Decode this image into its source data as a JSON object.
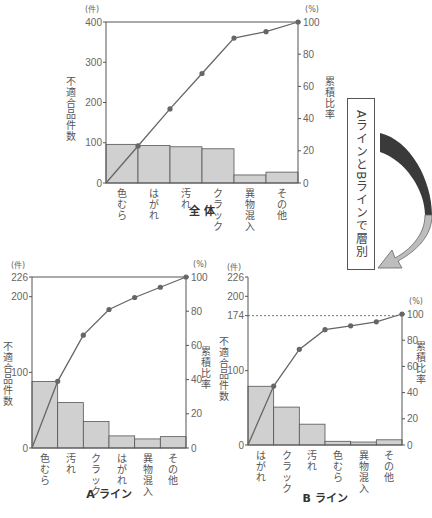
{
  "chart_data": [
    {
      "type": "bar+line (pareto)",
      "title": "全 体",
      "categories": [
        "色むら",
        "はがれ",
        "汚れ",
        "クラック",
        "異物混入",
        "その他"
      ],
      "series": [
        {
          "name": "不適合品件数",
          "values": [
            96,
            93,
            90,
            85,
            20,
            27
          ]
        },
        {
          "name": "累積比率",
          "values": [
            23,
            46,
            68,
            90,
            94,
            100
          ]
        }
      ],
      "ylabel": "不適合品件数",
      "ylabel_unit": "(件)",
      "y2label": "累積比率",
      "y2label_unit": "(%)",
      "ylim": [
        0,
        400
      ],
      "yticks": [
        0,
        100,
        200,
        300,
        400
      ],
      "y2lim": [
        0,
        100
      ],
      "y2ticks": [
        0,
        20,
        40,
        60,
        80,
        100
      ]
    },
    {
      "type": "bar+line (pareto)",
      "title": "A ライン",
      "categories": [
        "色むら",
        "汚れ",
        "クラック",
        "はがれ",
        "異物混入",
        "その他"
      ],
      "series": [
        {
          "name": "不適合品件数",
          "values": [
            88,
            60,
            35,
            16,
            12,
            15
          ]
        },
        {
          "name": "累積比率",
          "values": [
            39,
            66,
            81,
            88,
            94,
            100
          ]
        }
      ],
      "ylabel": "不適合品件数",
      "ylabel_unit": "(件)",
      "y2label": "累積比率",
      "y2label_unit": "(%)",
      "ylim": [
        0,
        226
      ],
      "yticks": [
        0,
        100,
        200,
        226
      ],
      "y2lim": [
        0,
        100
      ],
      "y2ticks": [
        0,
        20,
        40,
        60,
        80,
        100
      ]
    },
    {
      "type": "bar+line (pareto)",
      "title": "B ライン",
      "categories": [
        "はがれ",
        "クラック",
        "汚れ",
        "色むら",
        "異物混入",
        "その他"
      ],
      "series": [
        {
          "name": "不適合品件数",
          "values": [
            79,
            51,
            28,
            5,
            4,
            7
          ]
        },
        {
          "name": "累積比率",
          "values": [
            45,
            73,
            88,
            91,
            94,
            100
          ]
        }
      ],
      "ylabel": "不適合品件数",
      "ylabel_unit": "(件)",
      "y2label": "累積比率",
      "y2label_unit": "(%)",
      "ylim": [
        0,
        226
      ],
      "yticks": [
        0,
        100,
        174,
        200,
        226
      ],
      "y2lim": [
        0,
        174
      ],
      "y2ticks": [
        0,
        20,
        40,
        60,
        80,
        100
      ],
      "total_line": 174
    }
  ],
  "annotation": {
    "layer_label": "AラインとBラインで層別"
  },
  "colors": {
    "bar_fill": "#d0d0d0",
    "bar_stroke": "#555555",
    "line": "#666666",
    "dot": "#666666",
    "arrow_dark": "#3a3a3a",
    "arrow_light": "#bdbdbd"
  }
}
